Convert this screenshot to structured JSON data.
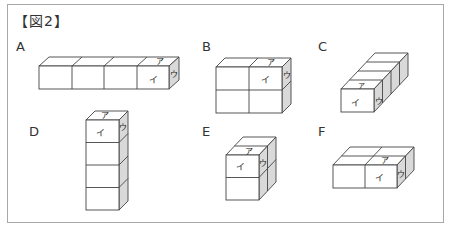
{
  "figure": {
    "title": "【図2】",
    "face_labels": {
      "top": "ア",
      "front": "イ",
      "side": "ウ"
    },
    "colors": {
      "border": "#a8a8a8",
      "cube_face": "#ffffff",
      "side_face": "#d9d9d9",
      "line": "#444444"
    },
    "shapes": [
      {
        "label": "A",
        "arrangement": "4 cubes in a horizontal row (4×1×1)"
      },
      {
        "label": "B",
        "arrangement": "2×2 block, one cube deep (2 wide × 2 tall × 1 deep)"
      },
      {
        "label": "C",
        "arrangement": "4 cubes in a row extending backward (1×1×4)"
      },
      {
        "label": "D",
        "arrangement": "4 cubes stacked vertically (1 wide × 4 tall × 1 deep)"
      },
      {
        "label": "E",
        "arrangement": "1 wide × 2 tall × 2 deep"
      },
      {
        "label": "F",
        "arrangement": "2 wide × 1 tall × 2 deep"
      }
    ]
  }
}
